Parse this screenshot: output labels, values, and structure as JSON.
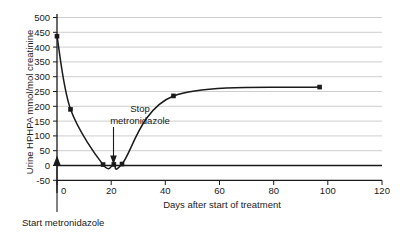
{
  "chart_data": {
    "type": "line",
    "title": "",
    "xlabel": "Days after start of treatment",
    "ylabel": "Urine HPHPA mmol/mol creatinine",
    "xlim": [
      0,
      120
    ],
    "ylim": [
      -50,
      500
    ],
    "xticks": [
      0,
      20,
      40,
      60,
      80,
      100,
      120
    ],
    "xtick_labels": [
      "0",
      "20",
      "40",
      "60",
      "80",
      "100",
      "120"
    ],
    "yticks": [
      -50,
      0,
      50,
      100,
      150,
      200,
      250,
      300,
      350,
      400,
      450,
      500
    ],
    "ytick_labels": [
      "-50",
      "0",
      "50",
      "100",
      "150",
      "200",
      "250",
      "300",
      "350",
      "400",
      "450",
      "500"
    ],
    "grid": true,
    "grid_axis": "y",
    "legend": false,
    "series": [
      {
        "name": "Urine HPHPA",
        "x": [
          0,
          5,
          17,
          21,
          24,
          43,
          97
        ],
        "values": [
          437,
          190,
          3,
          4,
          5,
          235,
          265
        ]
      }
    ],
    "annotations": [
      {
        "name": "stop-metronidazole",
        "line1": "Stop",
        "line2": "metronidazole",
        "arrow_x": 21,
        "arrow_y": 0
      },
      {
        "name": "start-metronidazole",
        "text": "Start metronidazole",
        "arrow_x": 0,
        "arrow_y": 0
      }
    ],
    "colors": {
      "curve": "#1a1a1a",
      "grid": "#b9b9b9",
      "axis": "#1a1a1a",
      "text": "#1a1a1a",
      "background": "#ffffff"
    }
  }
}
